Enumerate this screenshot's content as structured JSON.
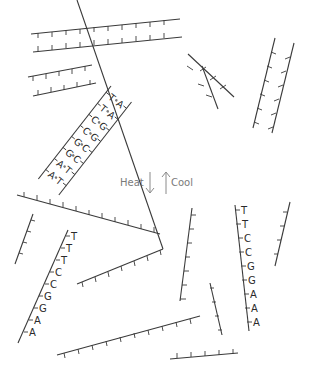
{
  "diagram": {
    "process": {
      "heat_label": "Heat",
      "cool_label": "Cool",
      "heat_direction": "down",
      "cool_direction": "up"
    },
    "double_helix": {
      "pairs": [
        {
          "left": "T",
          "right": "A"
        },
        {
          "left": "T",
          "right": "A"
        },
        {
          "left": "C",
          "right": "G"
        },
        {
          "left": "C",
          "right": "G"
        },
        {
          "left": "G",
          "right": "C"
        },
        {
          "left": "G",
          "right": "C"
        },
        {
          "left": "A",
          "right": "T"
        },
        {
          "left": "A",
          "right": "T"
        }
      ]
    },
    "single_strand_left": {
      "bases": [
        "T",
        "T",
        "T",
        "C",
        "C",
        "G",
        "G",
        "A",
        "A"
      ]
    },
    "single_strand_right": {
      "bases": [
        "T",
        "T",
        "C",
        "C",
        "G",
        "G",
        "A",
        "A",
        "A"
      ]
    },
    "colors": {
      "strand": "#3a3a3a",
      "label": "#7a7a7a",
      "background": "#ffffff"
    }
  }
}
